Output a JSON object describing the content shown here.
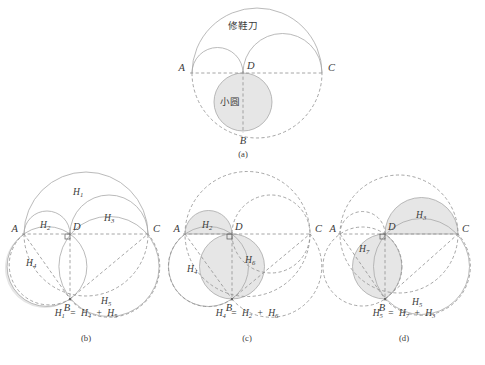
{
  "figure": {
    "title_region": "arbelos-decomposition-figure",
    "background_color": "#ffffff",
    "shade_color": "#e6e6e6",
    "line_color": "#a8a8a8",
    "dash_color": "#8f8f8f",
    "text_color": "#3a3a3a"
  },
  "panels": [
    {
      "id": "a",
      "caption": "(a)",
      "points": [
        {
          "name": "A",
          "label": "A"
        },
        {
          "name": "D",
          "label": "D"
        },
        {
          "name": "C",
          "label": "C"
        },
        {
          "name": "B",
          "label": "B"
        }
      ],
      "annotations": [
        {
          "name": "arbelos-label",
          "label": "修鞋刀"
        },
        {
          "name": "incircle-label",
          "label": "小圆"
        }
      ]
    },
    {
      "id": "b",
      "caption": "(b)",
      "points": [
        {
          "name": "A",
          "label": "A"
        },
        {
          "name": "D",
          "label": "D"
        },
        {
          "name": "C",
          "label": "C"
        },
        {
          "name": "B",
          "label": "B"
        }
      ],
      "region_labels": [
        {
          "name": "region-h1",
          "base": "H",
          "sub": "1"
        },
        {
          "name": "region-h2",
          "base": "H",
          "sub": "2"
        },
        {
          "name": "region-h3",
          "base": "H",
          "sub": "3"
        },
        {
          "name": "region-h4",
          "base": "H",
          "sub": "4"
        },
        {
          "name": "region-h5",
          "base": "H",
          "sub": "5"
        }
      ],
      "equation": {
        "lhs": {
          "base": "H",
          "sub": "1"
        },
        "eq": "=",
        "rhs1": {
          "base": "H",
          "sub": "4"
        },
        "plus": "+",
        "rhs2": {
          "base": "H",
          "sub": "5"
        }
      }
    },
    {
      "id": "c",
      "caption": "(c)",
      "points": [
        {
          "name": "A",
          "label": "A"
        },
        {
          "name": "D",
          "label": "D"
        },
        {
          "name": "C",
          "label": "C"
        },
        {
          "name": "B",
          "label": "B"
        }
      ],
      "region_labels": [
        {
          "name": "region-h2",
          "base": "H",
          "sub": "2"
        },
        {
          "name": "region-h4",
          "base": "H",
          "sub": "4"
        },
        {
          "name": "region-h6",
          "base": "H",
          "sub": "6"
        }
      ],
      "equation": {
        "lhs": {
          "base": "H",
          "sub": "4"
        },
        "eq": "=",
        "rhs1": {
          "base": "H",
          "sub": "2"
        },
        "plus": "+",
        "rhs2": {
          "base": "H",
          "sub": "6"
        }
      }
    },
    {
      "id": "d",
      "caption": "(d)",
      "points": [
        {
          "name": "A",
          "label": "A"
        },
        {
          "name": "D",
          "label": "D"
        },
        {
          "name": "C",
          "label": "C"
        },
        {
          "name": "B",
          "label": "B"
        }
      ],
      "region_labels": [
        {
          "name": "region-h3",
          "base": "H",
          "sub": "3"
        },
        {
          "name": "region-h5",
          "base": "H",
          "sub": "5"
        },
        {
          "name": "region-h7",
          "base": "H",
          "sub": "7"
        }
      ],
      "equation": {
        "lhs": {
          "base": "H",
          "sub": "5"
        },
        "eq": "=",
        "rhs1": {
          "base": "H",
          "sub": "7"
        },
        "plus": "+",
        "rhs2": {
          "base": "H",
          "sub": "3"
        }
      }
    }
  ]
}
